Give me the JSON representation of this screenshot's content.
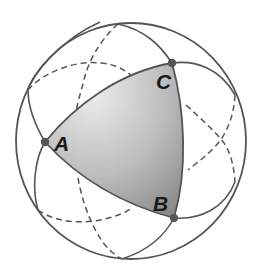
{
  "diagram": {
    "vertices": [
      {
        "id": "A",
        "label": "A",
        "x": 45,
        "y": 142
      },
      {
        "id": "B",
        "label": "B",
        "x": 174,
        "y": 218
      },
      {
        "id": "C",
        "label": "C",
        "x": 172,
        "y": 63
      }
    ],
    "labels": {
      "A": "A",
      "B": "B",
      "C": "C"
    },
    "sphere": {
      "cx": 131,
      "cy": 141,
      "rx": 115,
      "ry": 118
    },
    "great_circles": 3,
    "colors": {
      "stroke": "#555555",
      "fill_light": "#e6e6e6",
      "fill_dark": "#8f8f8f",
      "label": "#1a1a1a"
    }
  }
}
